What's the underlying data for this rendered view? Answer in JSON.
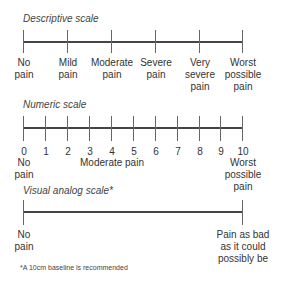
{
  "descriptive": {
    "title": "Descriptive scale",
    "labels": [
      "No\npain",
      "Mild\npain",
      "Moderate\npain",
      "Severe\npain",
      "Very\nsevere\npain",
      "Worst\npossible\npain"
    ]
  },
  "numeric": {
    "title": "Numeric scale",
    "numbers": [
      "0",
      "1",
      "2",
      "3",
      "4",
      "5",
      "6",
      "7",
      "8",
      "9",
      "10"
    ],
    "left_label": "No\npain",
    "middle_label": "Moderate pain",
    "right_label": "Worst\npossible\npain"
  },
  "vas": {
    "title": "Visual analog  scale*",
    "left_label": "No\npain",
    "right_label": "Pain as bad\nas it could\npossibly be"
  },
  "footnote": "*A 10cm baseline is recommended"
}
